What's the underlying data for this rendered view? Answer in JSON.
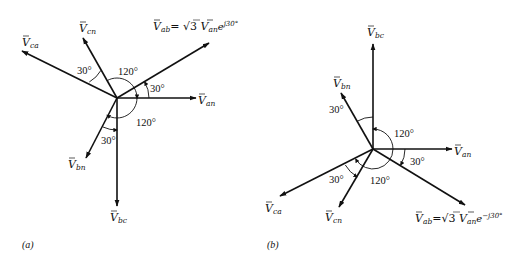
{
  "figure": {
    "panels": [
      {
        "id": "a",
        "caption": "(a)",
        "origin": [
          117,
          98
        ],
        "vectors": [
          {
            "name": "Van",
            "base": "V",
            "sub": "an",
            "angle_deg": 0,
            "tip": [
              196,
              98
            ],
            "label_pos": [
              198,
              104
            ]
          },
          {
            "name": "Vab",
            "base": "V",
            "sub": "ab",
            "angle_deg": 30,
            "tip": [
              209,
              43
            ],
            "label_pos": [
              153,
              30
            ],
            "expr": "= √3 ",
            "expr_base": "V",
            "expr_sub": "an",
            "expr_exp": "e",
            "expr_sup": "j30°"
          },
          {
            "name": "Vcn",
            "base": "V",
            "sub": "cn",
            "angle_deg": 120,
            "tip": [
              83,
              38
            ],
            "label_pos": [
              79,
              32
            ]
          },
          {
            "name": "Vca",
            "base": "V",
            "sub": "ca",
            "angle_deg": 150,
            "tip": [
              22,
              51
            ],
            "label_pos": [
              22,
              46
            ]
          },
          {
            "name": "Vbn",
            "base": "V",
            "sub": "bn",
            "angle_deg": 240,
            "tip": [
              86,
              158
            ],
            "label_pos": [
              68,
              168
            ]
          },
          {
            "name": "Vbc",
            "base": "V",
            "sub": "bc",
            "angle_deg": 270,
            "tip": [
              117,
              206
            ],
            "label_pos": [
              110,
              221
            ]
          }
        ],
        "angle_labels": [
          {
            "text": "30°",
            "pos": [
              150,
              92
            ]
          },
          {
            "text": "120°",
            "pos": [
              118,
              75
            ]
          },
          {
            "text": "120°",
            "pos": [
              136,
              126
            ]
          },
          {
            "text": "30°",
            "pos": [
              77,
              74
            ]
          },
          {
            "text": "30°",
            "pos": [
              101,
              144
            ]
          }
        ]
      },
      {
        "id": "b",
        "caption": "(b)",
        "origin": [
          373,
          149
        ],
        "vectors": [
          {
            "name": "Van",
            "base": "V",
            "sub": "an",
            "angle_deg": 0,
            "tip": [
              452,
              149
            ],
            "label_pos": [
              454,
              155
            ]
          },
          {
            "name": "Vab",
            "base": "V",
            "sub": "ab",
            "angle_deg": -30,
            "tip": [
              465,
              205
            ],
            "label_pos": [
              415,
              222
            ],
            "expr": "=√3 ",
            "expr_base": "V",
            "expr_sub": "an",
            "expr_exp": "e",
            "expr_sup": "−j30°"
          },
          {
            "name": "Vbc",
            "base": "V",
            "sub": "bc",
            "angle_deg": 90,
            "tip": [
              373,
              44
            ],
            "label_pos": [
              367,
              36
            ]
          },
          {
            "name": "Vbn",
            "base": "V",
            "sub": "bn",
            "angle_deg": 120,
            "tip": [
              341,
              93
            ],
            "label_pos": [
              333,
              87
            ]
          },
          {
            "name": "Vca",
            "base": "V",
            "sub": "ca",
            "angle_deg": 210,
            "tip": [
              280,
              196
            ],
            "label_pos": [
              265,
              212
            ]
          },
          {
            "name": "Vcn",
            "base": "V",
            "sub": "cn",
            "angle_deg": 240,
            "tip": [
              339,
              207
            ],
            "label_pos": [
              325,
              221
            ]
          }
        ],
        "angle_labels": [
          {
            "text": "30°",
            "pos": [
              329,
              113
            ]
          },
          {
            "text": "120°",
            "pos": [
              394,
              137
            ]
          },
          {
            "text": "30°",
            "pos": [
              410,
              165
            ]
          },
          {
            "text": "120°",
            "pos": [
              370,
              184
            ]
          },
          {
            "text": "30°",
            "pos": [
              329,
              183
            ]
          }
        ]
      }
    ]
  }
}
